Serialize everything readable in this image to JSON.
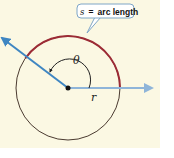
{
  "diagram": {
    "type": "arc-length-circle",
    "callout": {
      "variable": "s",
      "equals": "=",
      "text": "arc length"
    },
    "labels": {
      "angle": "θ",
      "radius": "r"
    },
    "colors": {
      "background": "#fbf8e3",
      "circle": "#4a3a30",
      "arc": "#9c2b35",
      "ray": "#3f86c2",
      "ray_right": "#8fb5d9",
      "callout_border": "#7fa6c6",
      "callout_fill": "#ffffff"
    }
  }
}
